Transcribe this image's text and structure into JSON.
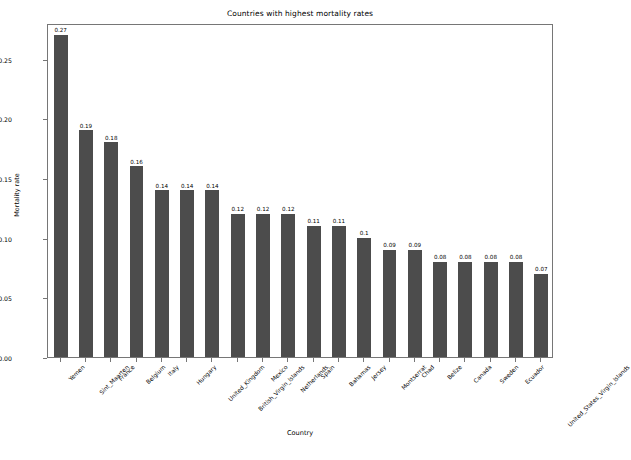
{
  "chart_data": {
    "type": "bar",
    "title": "Countries with highest mortality rates",
    "xlabel": "Country",
    "ylabel": "Mortality rate",
    "ylim": [
      0.0,
      0.28
    ],
    "yticks": [
      "0.00",
      "0.05",
      "0.10",
      "0.15",
      "0.20",
      "0.25"
    ],
    "ytick_values": [
      0.0,
      0.05,
      0.1,
      0.15,
      0.2,
      0.25
    ],
    "grid": false,
    "legend": null,
    "bar_color": "#4c4c4c",
    "categories": [
      "Yemen",
      "Sint_Maarten",
      "France",
      "Belgium",
      "Italy",
      "Hungary",
      "United_Kingdom",
      "British_Virgin_Islands",
      "Mexico",
      "Netherlands",
      "Spain",
      "Bahamas",
      "Jersey",
      "Montserrat",
      "Chad",
      "Belize",
      "Canada",
      "Sweden",
      "Ecuador",
      "United_States_Virgin_Islands"
    ],
    "values": [
      0.27,
      0.19,
      0.18,
      0.16,
      0.14,
      0.14,
      0.14,
      0.12,
      0.12,
      0.12,
      0.11,
      0.11,
      0.1,
      0.09,
      0.09,
      0.08,
      0.08,
      0.08,
      0.08,
      0.07
    ],
    "value_labels": [
      "0.27",
      "0.19",
      "0.18",
      "0.16",
      "0.14",
      "0.14",
      "0.14",
      "0.12",
      "0.12",
      "0.12",
      "0.11",
      "0.11",
      "0.1",
      "0.09",
      "0.09",
      "0.08",
      "0.08",
      "0.08",
      "0.08",
      "0.07"
    ]
  }
}
